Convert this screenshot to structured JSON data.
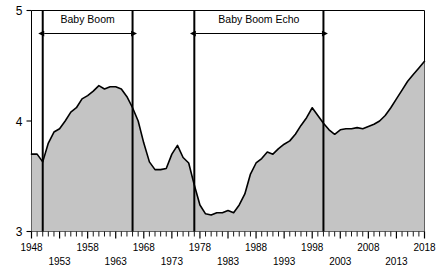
{
  "chart_data": {
    "type": "area",
    "title": "",
    "xlabel": "",
    "ylabel": "",
    "xlim": [
      1948,
      2018
    ],
    "ylim": [
      3,
      5
    ],
    "grid": false,
    "legend": null,
    "y_ticks": [
      3,
      4,
      5
    ],
    "y_tick_labels": [
      "3",
      "4",
      "5"
    ],
    "x_ticks": [
      1948,
      1953,
      1958,
      1963,
      1968,
      1973,
      1978,
      1983,
      1988,
      1993,
      1998,
      2003,
      2008,
      2013,
      2018
    ],
    "x_tick_labels": [
      "1948",
      "1953",
      "1958",
      "1963",
      "1968",
      "1973",
      "1978",
      "1983",
      "1988",
      "1993",
      "1998",
      "2003",
      "2008",
      "2013",
      "2018"
    ],
    "x_minor_tick_interval": 1,
    "series_name": "index",
    "fill_color": "#c4c4c4",
    "line_color": "#000000",
    "x": [
      1948,
      1949,
      1950,
      1951,
      1952,
      1953,
      1954,
      1955,
      1956,
      1957,
      1958,
      1959,
      1960,
      1961,
      1962,
      1963,
      1964,
      1965,
      1966,
      1967,
      1968,
      1969,
      1970,
      1971,
      1972,
      1973,
      1974,
      1975,
      1976,
      1977,
      1978,
      1979,
      1980,
      1981,
      1982,
      1983,
      1984,
      1985,
      1986,
      1987,
      1988,
      1989,
      1990,
      1991,
      1992,
      1993,
      1994,
      1995,
      1996,
      1997,
      1998,
      1999,
      2000,
      2001,
      2002,
      2003,
      2004,
      2005,
      2006,
      2007,
      2008,
      2009,
      2010,
      2011,
      2012,
      2013,
      2014,
      2015,
      2016,
      2017,
      2018
    ],
    "values": [
      3.7,
      3.7,
      3.63,
      3.8,
      3.9,
      3.93,
      4.0,
      4.08,
      4.12,
      4.2,
      4.23,
      4.27,
      4.32,
      4.29,
      4.31,
      4.31,
      4.29,
      4.22,
      4.12,
      4.0,
      3.8,
      3.63,
      3.56,
      3.56,
      3.57,
      3.7,
      3.78,
      3.67,
      3.62,
      3.42,
      3.24,
      3.16,
      3.15,
      3.17,
      3.17,
      3.19,
      3.17,
      3.24,
      3.34,
      3.52,
      3.62,
      3.66,
      3.72,
      3.7,
      3.75,
      3.79,
      3.82,
      3.88,
      3.96,
      4.03,
      4.12,
      4.05,
      3.98,
      3.92,
      3.88,
      3.92,
      3.93,
      3.93,
      3.94,
      3.93,
      3.95,
      3.97,
      4.0,
      4.05,
      4.12,
      4.2,
      4.28,
      4.36,
      4.42,
      4.48,
      4.54
    ],
    "annotations": [
      {
        "label": "Baby Boom",
        "start": 1950,
        "end": 1966,
        "type": "span-arrow"
      },
      {
        "label": "Baby Boom Echo",
        "start": 1977,
        "end": 2000,
        "type": "span-arrow"
      }
    ],
    "vertical_markers": [
      1950,
      1966,
      1977,
      2000
    ]
  }
}
